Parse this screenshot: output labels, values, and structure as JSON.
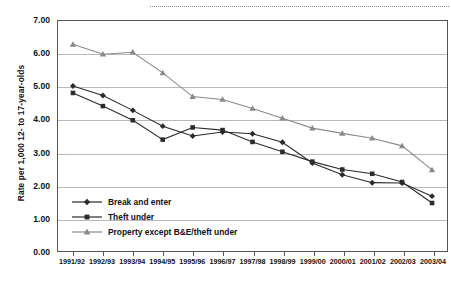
{
  "figure": {
    "decorative_rule": "dotted-rule"
  },
  "chart_data": {
    "type": "line",
    "title": "",
    "xlabel": "",
    "ylabel": "Rate per 1,000 12- to 17-year-olds",
    "ylim": [
      0.0,
      7.0
    ],
    "ytick_labels": [
      "7.00",
      "6.00",
      "5.00",
      "4.00",
      "3.00",
      "2.00",
      "1.00",
      "0.00"
    ],
    "ytick_values": [
      7.0,
      6.0,
      5.0,
      4.0,
      3.0,
      2.0,
      1.0,
      0.0
    ],
    "grid": true,
    "grid_axis": "y",
    "legend_position": "lower-left-inside",
    "categories": [
      "1991/92",
      "1992/93",
      "1993/94",
      "1994/95",
      "1995/96",
      "1996/97",
      "1997/98",
      "1998/99",
      "1999/00",
      "2000/01",
      "2001/02",
      "2002/03",
      "2003/04"
    ],
    "series": [
      {
        "name": "Break and enter",
        "marker": "diamond",
        "color": "#2b2b2b",
        "values": [
          5.02,
          4.73,
          4.28,
          3.8,
          3.5,
          3.62,
          3.57,
          3.31,
          2.68,
          2.32,
          2.08,
          2.07,
          1.67
        ]
      },
      {
        "name": "Theft under",
        "marker": "square",
        "color": "#2b2b2b",
        "values": [
          4.81,
          4.41,
          3.98,
          3.39,
          3.76,
          3.68,
          3.32,
          3.02,
          2.72,
          2.48,
          2.35,
          2.1,
          1.46
        ]
      },
      {
        "name": "Property except B&E/theft under",
        "marker": "triangle",
        "color": "#8a8a8a",
        "values": [
          6.29,
          5.99,
          6.05,
          5.42,
          4.7,
          4.61,
          4.34,
          4.04,
          3.74,
          3.58,
          3.43,
          3.2,
          2.47
        ]
      }
    ]
  }
}
